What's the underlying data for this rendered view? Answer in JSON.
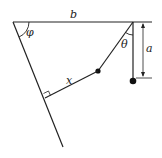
{
  "diagram": {
    "type": "physics-pendulum-geometry",
    "labels": {
      "b": "b",
      "a": "a",
      "theta": "θ",
      "phi": "φ",
      "x": "x"
    },
    "colors": {
      "line": "#222222",
      "background": "#ffffff"
    }
  }
}
